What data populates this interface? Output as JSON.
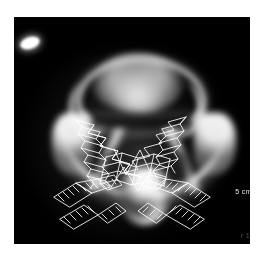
{
  "figure": {
    "kind": "medical-scan",
    "modality": "CT axial slice",
    "alt": "Axial CT slice of a cervical vertebra with white wireframe mesh overlays",
    "canvas": {
      "background_color": "#000000",
      "page_background_color": "#ffffff",
      "x": 14,
      "y": 17,
      "width": 236,
      "height": 227
    }
  },
  "annotations": {
    "scale_label": "5 cm",
    "corner_mark": "r 1",
    "fiducial_name": "fiducial-marker"
  },
  "anatomy": {
    "airway_ring": "airway-ring",
    "airway_mass": "airway-soft-tissue-mass",
    "airway_left_horn": "airway-left-horn",
    "airway_right_horn": "airway-right-horn",
    "lamina_left": "lamina-left",
    "lamina_right": "lamina-right",
    "vertebral_trough": "vertebral-trough",
    "transverse_left": "transverse-process-left",
    "transverse_right": "transverse-process-right",
    "spinous": "spinous-process",
    "body_core": "vertebral-body-core"
  },
  "mesh_overlay": {
    "stroke_color": "#ffffff",
    "stroke_width": 0.85,
    "groups": [
      "mesh-lamina-left",
      "mesh-lamina-right",
      "mesh-center-band",
      "mesh-screw-left-upper",
      "mesh-screw-left-lower",
      "mesh-screw-right-upper",
      "mesh-screw-right-lower"
    ]
  }
}
